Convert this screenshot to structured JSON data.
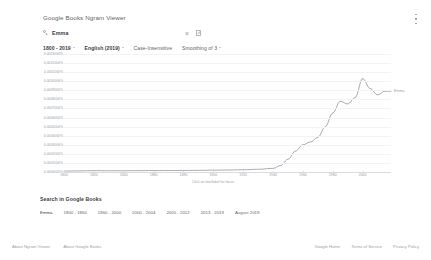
{
  "header": {
    "app_title": "Google Books Ngram Viewer",
    "menu_icon": "kebab-menu-icon"
  },
  "search": {
    "icon": "search-icon",
    "query": "Emma",
    "clear_icon": "clear-icon",
    "share_icon": "share-icon"
  },
  "filters": [
    {
      "label": "1800 - 2019",
      "has_caret": true,
      "strong": true
    },
    {
      "label": "English (2019)",
      "has_caret": true,
      "strong": true
    },
    {
      "label": "Case-Insensitive",
      "has_caret": false,
      "strong": false
    },
    {
      "label": "Smoothing of 3",
      "has_caret": true,
      "strong": false
    }
  ],
  "chart_data": {
    "type": "line",
    "title": "",
    "xlabel": "",
    "ylabel": "",
    "caption": "Click on line/label for focus",
    "grid": true,
    "legend_position": "inline-right",
    "xlim": [
      1800,
      2019
    ],
    "ylim": [
      0,
      0.0013
    ],
    "ytick_labels": [
      "0.0013000%",
      "0.0012000%",
      "0.0011000%",
      "0.0010000%",
      "0.0009000%",
      "0.0008000%",
      "0.0007000%",
      "0.0006000%",
      "0.0005000%",
      "0.0004000%",
      "0.0003000%",
      "0.0002000%",
      "0.0001000%",
      "0.0000000%"
    ],
    "ytick_values": [
      0.0013,
      0.0012,
      0.0011,
      0.001,
      0.0009,
      0.0008,
      0.0007,
      0.0006,
      0.0005,
      0.0004,
      0.0003,
      0.0002,
      0.0001,
      0.0
    ],
    "xtick_labels": [
      "1800",
      "1820",
      "1840",
      "1860",
      "1880",
      "1900",
      "1920",
      "1940",
      "1960",
      "1980",
      "2000"
    ],
    "xtick_values": [
      1800,
      1820,
      1840,
      1860,
      1880,
      1900,
      1920,
      1940,
      1960,
      1980,
      2000
    ],
    "series": [
      {
        "name": "Emma",
        "color": "#5f6368",
        "x": [
          1800,
          1810,
          1820,
          1830,
          1840,
          1850,
          1860,
          1870,
          1880,
          1890,
          1900,
          1910,
          1920,
          1930,
          1940,
          1945,
          1950,
          1955,
          1960,
          1965,
          1970,
          1975,
          1980,
          1985,
          1990,
          1995,
          2000,
          2005,
          2010,
          2015,
          2019
        ],
        "y": [
          1e-05,
          1.2e-05,
          1.5e-05,
          1.4e-05,
          1.4e-05,
          1.5e-05,
          1.6e-05,
          1.6e-05,
          1.7e-05,
          1.8e-05,
          2e-05,
          2.2e-05,
          2.5e-05,
          3e-05,
          4e-05,
          7e-05,
          0.00014,
          0.00023,
          0.0003,
          0.00033,
          0.00038,
          0.0005,
          0.00065,
          0.00078,
          0.00075,
          0.00082,
          0.00103,
          0.00092,
          0.00085,
          0.00089,
          0.00089
        ]
      }
    ]
  },
  "books_section": {
    "title": "Search in Google Books",
    "chips": [
      "Emma",
      "1800 - 1860",
      "1860 - 2000",
      "2000 - 2004",
      "2005 - 2012",
      "2013 - 2019",
      "August 2019"
    ]
  },
  "footer": {
    "left_links": [
      "About Ngram Viewer",
      "About Google Books"
    ],
    "right_links": [
      "Google Home",
      "Terms of Service",
      "Privacy Policy"
    ]
  }
}
